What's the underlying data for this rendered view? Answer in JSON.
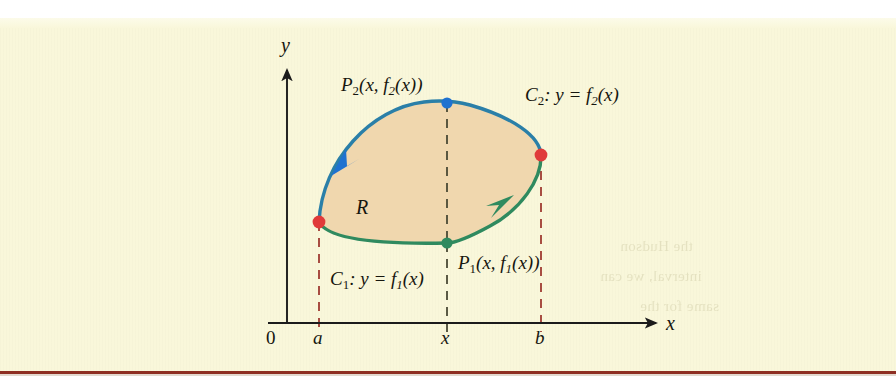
{
  "figure": {
    "kind": "green-theorem-region-diagram",
    "panel_bg": "#f9f7da",
    "page_rule_color": "#8e2f23",
    "region": {
      "label": "R",
      "fill": "#f0d7ae",
      "stroke": "none"
    },
    "axes": {
      "x_label": "x",
      "y_label": "y",
      "origin_label": "0",
      "axis_color": "#1b1b1b"
    },
    "ticks": [
      {
        "name": "a",
        "label": "a",
        "x_px": 319,
        "dash_color": "#a4453a"
      },
      {
        "name": "x",
        "label": "x",
        "x_px": 447,
        "dash_color": "#4a4a36"
      },
      {
        "name": "b",
        "label": "b",
        "x_px": 541,
        "dash_color": "#a4453a"
      }
    ],
    "curves": [
      {
        "id": "C2",
        "label_prefix": "C",
        "label_sub": "2",
        "label_equation": ":  y = f",
        "label_eq_sub": "2",
        "label_eq_tail": "(x)",
        "color": "#2a7fa8",
        "arrow_color": "#1f72d0",
        "direction": "leftward along upper arc"
      },
      {
        "id": "C1",
        "label_prefix": "C",
        "label_sub": "1",
        "label_equation": ":  y = f",
        "label_eq_sub": "1",
        "label_eq_tail": "(x)",
        "color": "#2f8a5f",
        "arrow_color": "#2f8a5f",
        "direction": "rightward along lower arc"
      }
    ],
    "points": [
      {
        "id": "P2",
        "label_prefix": "P",
        "label_sub": "2",
        "label_tail": "(x, f",
        "label_tail_sub": "2",
        "label_tail_end": "(x))",
        "dot_color": "#1f72d0",
        "x_px": 447,
        "y_px": 103
      },
      {
        "id": "P1",
        "label_prefix": "P",
        "label_sub": "1",
        "label_tail": "(x, f",
        "label_tail_sub": "1",
        "label_tail_end": "(x))",
        "dot_color": "#2f8a5f",
        "x_px": 447,
        "y_px": 243
      },
      {
        "id": "endpoint-a",
        "label": "",
        "dot_color": "#e03a3a",
        "x_px": 319,
        "y_px": 222
      },
      {
        "id": "endpoint-b",
        "label": "",
        "dot_color": "#e03a3a",
        "x_px": 541,
        "y_px": 155
      }
    ]
  },
  "bleed_text": {
    "line1": "the Hudson",
    "line2": "interval, we can",
    "line3": "same for the"
  }
}
